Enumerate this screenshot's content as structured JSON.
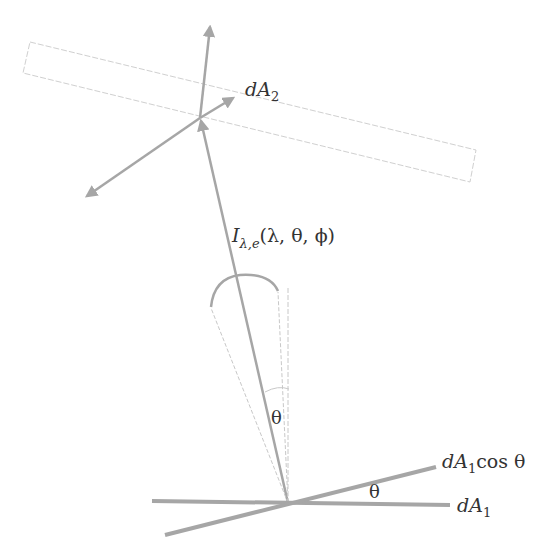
{
  "diagram": {
    "type": "radiation-geometry",
    "colors": {
      "line": "#a6a6a6",
      "thin_line": "#c8c8c8",
      "text": "#333333",
      "background": "#ffffff"
    },
    "labels": {
      "dA2": {
        "main": "dA",
        "sub": "2"
      },
      "intensity": {
        "main": "I",
        "sub": "λ,e",
        "args": "(λ, θ, ϕ)"
      },
      "theta_cone": "θ",
      "theta_surface": "θ",
      "dA1_cos": {
        "main": "dA",
        "sub": "1",
        "suffix": "cos θ"
      },
      "dA1": {
        "main": "dA",
        "sub": "1"
      }
    }
  }
}
